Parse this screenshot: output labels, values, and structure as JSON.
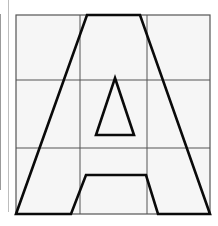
{
  "diagram": {
    "title": "Letter A on 3x3 grid",
    "grid": {
      "rows": 3,
      "cols": 3,
      "left": 16,
      "top": 15,
      "right": 210,
      "bottom": 214,
      "v_lines": [
        80,
        147
      ],
      "h_lines": [
        80,
        148
      ],
      "fill": "#f6f6f6",
      "line_color": "#555555"
    },
    "letter": {
      "glyph": "A",
      "stroke": "#0a0a0a",
      "outer_points": "87,15 140,15 210,214 158,214 146,175 86,175 71,214 16,214",
      "counter_points": "115,78 134,135 96,135"
    },
    "edge_lines": [
      {
        "x": 0,
        "top": 14,
        "height": 176
      },
      {
        "x": 8,
        "top": 0,
        "height": 212
      }
    ]
  }
}
